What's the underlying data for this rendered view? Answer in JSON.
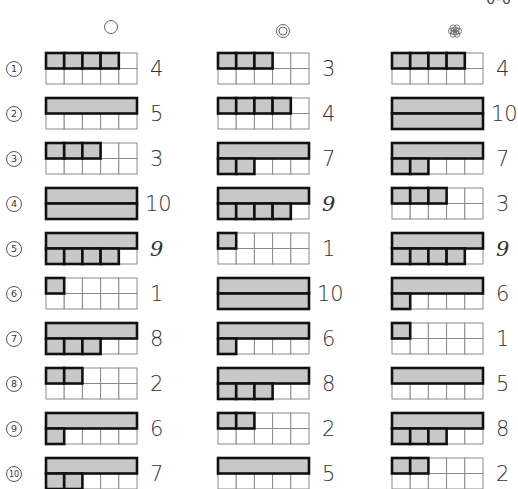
{
  "page_mark": "0-0",
  "columns": [
    {
      "header_icon": "single-circle-icon",
      "answers": [
        4,
        5,
        3,
        10,
        9,
        1,
        8,
        2,
        6,
        7
      ]
    },
    {
      "header_icon": "double-circle-icon",
      "answers": [
        3,
        4,
        7,
        9,
        1,
        10,
        6,
        8,
        2,
        5
      ]
    },
    {
      "header_icon": "flower-circle-icon",
      "answers": [
        4,
        10,
        7,
        3,
        9,
        6,
        1,
        5,
        8,
        2
      ]
    }
  ],
  "row_labels": [
    "1",
    "2",
    "3",
    "4",
    "5",
    "6",
    "7",
    "8",
    "9",
    "10"
  ],
  "layout": {
    "frame_x": [
      46,
      218,
      392
    ],
    "header_x": [
      103,
      275,
      447
    ],
    "header_y": [
      19,
      23,
      23
    ],
    "row_top_start": 53,
    "row_pitch": 45,
    "cell_w": 18.2,
    "cell_h": 15.5
  },
  "colors": {
    "fill": "#c8c8c8",
    "thick_border": "#111111",
    "thin_border": "#8a8a8a"
  }
}
